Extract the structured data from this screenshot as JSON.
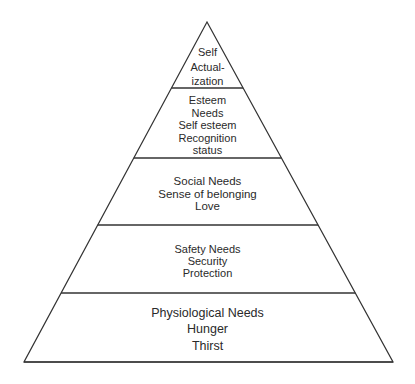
{
  "diagram": {
    "type": "pyramid",
    "title": "",
    "line_color": "#333333",
    "text_color": "#2a2a2a",
    "background": "#ffffff",
    "tiers": [
      {
        "level": 5,
        "name": "Self Actualization",
        "lines": [
          "Self",
          "Actual-",
          "ization"
        ]
      },
      {
        "level": 4,
        "name": "Esteem Needs",
        "lines": [
          "Esteem",
          "Needs",
          "Self esteem",
          "Recognition",
          "status"
        ]
      },
      {
        "level": 3,
        "name": "Social Needs",
        "lines": [
          "Social Needs",
          "Sense of belonging",
          "Love"
        ]
      },
      {
        "level": 2,
        "name": "Safety Needs",
        "lines": [
          "Safety Needs",
          "Security",
          "Protection"
        ]
      },
      {
        "level": 1,
        "name": "Physiological Needs",
        "lines": [
          "Physiological Needs",
          "Hunger",
          "Thirst"
        ]
      }
    ]
  }
}
